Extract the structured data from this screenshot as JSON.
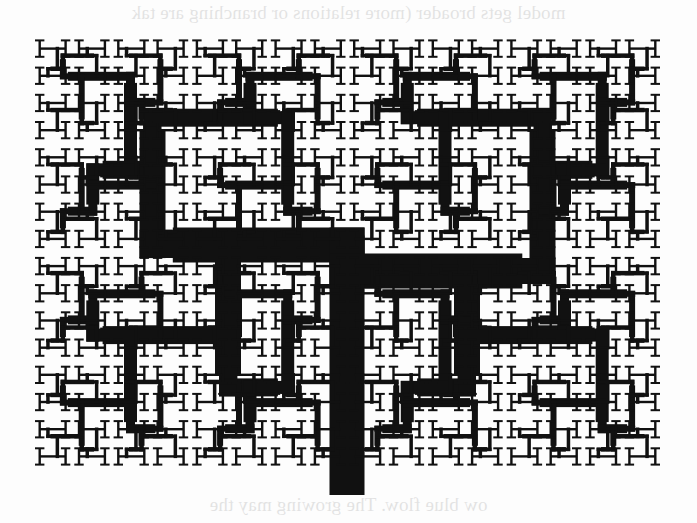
{
  "page": {
    "background": "#fdfdfd",
    "ink": "#111111",
    "bleed_through": {
      "top_line": "model gets broader (more relations or branching are tak",
      "bottom_line": "ow blue flow. The growing may the"
    }
  },
  "figure": {
    "type": "recursive branching tree (H-tree / river network)",
    "bounds": {
      "x0": 33,
      "y0": 35,
      "x1": 662,
      "y1": 470
    },
    "trunk": {
      "x": 347,
      "y_top": 253,
      "y_bottom": 495,
      "width": 35
    },
    "levels": 8,
    "stroke_widths": [
      35,
      26,
      18,
      13,
      9,
      6,
      4.5,
      3.5
    ],
    "leaf_glyph": "H-serif",
    "leaf_grid": {
      "cols": 16,
      "rows": 16
    },
    "stagger": 0.12
  }
}
